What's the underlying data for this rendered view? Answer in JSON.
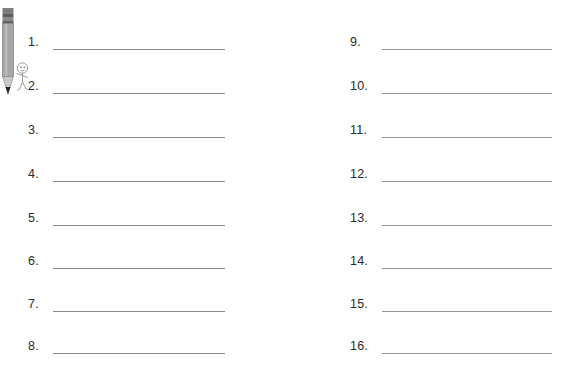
{
  "page": {
    "background_color": "#ffffff",
    "line_color": "#8a8a8a",
    "number_color": "#2b2b2b",
    "columns": 2,
    "rows_per_column": 8,
    "total_items": 16
  },
  "illustration": {
    "name": "pencil-with-cartoon-figure",
    "pencil_body_color": "#9a9a9a",
    "pencil_ferrule_color": "#6e6e6e",
    "pencil_tip_color": "#1f1f1f",
    "figure_outline_color": "#8c8c8c"
  },
  "left_column": {
    "items": [
      {
        "number": "1."
      },
      {
        "number": "2."
      },
      {
        "number": "3."
      },
      {
        "number": "4."
      },
      {
        "number": "5."
      },
      {
        "number": "6."
      },
      {
        "number": "7."
      },
      {
        "number": "8."
      }
    ]
  },
  "right_column": {
    "items": [
      {
        "number": "9."
      },
      {
        "number": "10."
      },
      {
        "number": "11."
      },
      {
        "number": "12."
      },
      {
        "number": "13."
      },
      {
        "number": "14."
      },
      {
        "number": "15."
      },
      {
        "number": "16."
      }
    ]
  }
}
